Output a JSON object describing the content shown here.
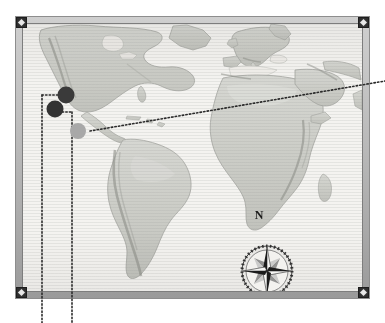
{
  "scene": {
    "title": "Framed relief world map with plotted site markers",
    "background_color": "#ffffff"
  },
  "frame": {
    "name": "map-frame",
    "band_color": "#bdbdbd",
    "inner_edge_color": "#7d7d7d",
    "x": 15,
    "y": 16,
    "width": 355,
    "height": 283,
    "band_thickness": 8,
    "corners": [
      {
        "id": "corner-tl",
        "label": "top-left-mount",
        "color": "#2e2e2e"
      },
      {
        "id": "corner-tr",
        "label": "top-right-mount",
        "color": "#2e2e2e"
      },
      {
        "id": "corner-bl",
        "label": "bottom-left-mount",
        "color": "#2e2e2e"
      },
      {
        "id": "corner-br",
        "label": "bottom-right-mount",
        "color": "#2e2e2e"
      }
    ]
  },
  "map": {
    "name": "world-relief-map",
    "projection_note": "Atlantic-centred world view",
    "paper_color": "#f4f3f0",
    "land_color": "#cfd0cb",
    "land_shadow_color": "#9a9c96",
    "continents": [
      "North America",
      "Central America",
      "South America",
      "Greenland",
      "Europe",
      "Africa",
      "Arabian Peninsula"
    ]
  },
  "markers": [
    {
      "id": "marker-1",
      "label": "site-marker-north",
      "color": "#3a3a3a",
      "x": 66,
      "y": 95,
      "diameter": 17
    },
    {
      "id": "marker-2",
      "label": "site-marker-west",
      "color": "#333333",
      "x": 55,
      "y": 109,
      "diameter": 17
    },
    {
      "id": "marker-3",
      "label": "site-marker-south",
      "color": "#a8a8a8",
      "x": 78,
      "y": 131,
      "diameter": 16
    }
  ],
  "leader_lines": [
    {
      "id": "leader-east",
      "label": "dotted-leader-to-right-edge",
      "color": "#2b2b2b",
      "from_x": 90,
      "from_y": 131,
      "to_x": 385,
      "to_y": 81,
      "style": "dotted"
    },
    {
      "id": "leader-down-a",
      "label": "dotted-leader-down-left",
      "color": "#2b2b2b",
      "from_x": 42,
      "from_y": 95,
      "to_x": 42,
      "to_y": 323,
      "style": "dotted"
    },
    {
      "id": "leader-down-b",
      "label": "dotted-leader-down-right",
      "color": "#2b2b2b",
      "from_x": 72,
      "from_y": 112,
      "to_x": 72,
      "to_y": 323,
      "style": "dotted"
    },
    {
      "id": "leader-horizontal-a",
      "label": "dotted-leader-horizontal-to-marker-1",
      "color": "#2b2b2b",
      "from_x": 42,
      "from_y": 95,
      "to_x": 66,
      "to_y": 95,
      "style": "dotted"
    },
    {
      "id": "leader-horizontal-b",
      "label": "dotted-leader-horizontal-to-marker-2",
      "color": "#2b2b2b",
      "from_x": 55,
      "from_y": 112,
      "to_x": 72,
      "to_y": 112,
      "style": "dotted"
    }
  ],
  "compass": {
    "name": "compass-rose",
    "north_label": "N",
    "center_x": 259,
    "center_y": 254,
    "radius": 24,
    "ring_color": "#e6e5e2",
    "point_dark_color": "#1c1c1c",
    "point_light_color": "#f5f5f3",
    "point_grey_color": "#8e8e8e",
    "label_x": 259,
    "label_y": 216,
    "label_size": 12
  }
}
